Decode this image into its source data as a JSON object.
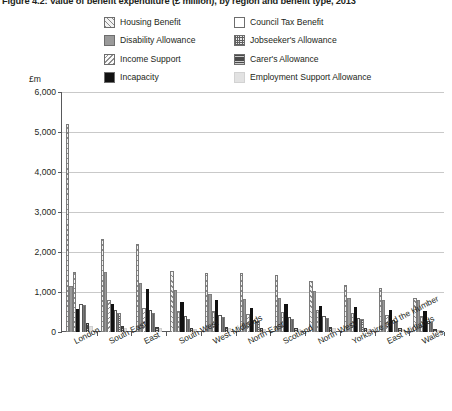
{
  "title": "Figure 4.2: Value of benefit expenditure (£ million), by region and benefit type, 2013",
  "axis": {
    "y_unit": "£m",
    "y_ticks": [
      "6,000",
      "5,000",
      "4,000",
      "3,000",
      "2,000",
      "1,000",
      "0"
    ]
  },
  "legend": {
    "items": [
      {
        "label": "Housing Benefit",
        "pattern": "p-housing",
        "icon": "diagonal-hatch-swatch"
      },
      {
        "label": "Council Tax Benefit",
        "pattern": "p-council",
        "icon": "empty-swatch"
      },
      {
        "label": "Disability Allowance",
        "pattern": "p-disability",
        "icon": "solid-grey-swatch"
      },
      {
        "label": "Jobseeker's Allowance",
        "pattern": "p-jobseeker",
        "icon": "crosshatch-swatch"
      },
      {
        "label": "Income Support",
        "pattern": "p-income",
        "icon": "reverse-hatch-swatch"
      },
      {
        "label": "Carer's Allowance",
        "pattern": "p-carer",
        "icon": "dark-textured-swatch"
      },
      {
        "label": "Incapacity",
        "pattern": "p-incapacity",
        "icon": "solid-black-swatch"
      },
      {
        "label": "Employment Support Allowance",
        "pattern": "p-esa",
        "icon": "light-grey-swatch"
      }
    ]
  },
  "chart_data": {
    "type": "bar",
    "title": "Figure 4.2: Value of benefit expenditure (£ million), by region and benefit type, 2013",
    "xlabel": "",
    "ylabel": "£m",
    "ylim": [
      0,
      6000
    ],
    "ytick_step": 1000,
    "grid": true,
    "legend_position": "top",
    "categories": [
      "London",
      "South East",
      "East",
      "South West",
      "West Midlands",
      "North East",
      "Scotland",
      "North West",
      "Yorkshire and the Humber",
      "East Midlands",
      "Wales"
    ],
    "series": [
      {
        "name": "Housing Benefit",
        "pattern": "p-housing",
        "values": [
          5200,
          2330,
          2210,
          1520,
          1470,
          1480,
          1420,
          1270,
          1180,
          1090,
          860
        ]
      },
      {
        "name": "Disability Allowance",
        "pattern": "p-disability",
        "values": [
          1150,
          1500,
          1230,
          1060,
          960,
          830,
          860,
          1030,
          850,
          790,
          810
        ]
      },
      {
        "name": "Income Support",
        "pattern": "p-income",
        "values": [
          1500,
          790,
          610,
          520,
          530,
          440,
          510,
          540,
          480,
          430,
          390
        ]
      },
      {
        "name": "Incapacity",
        "pattern": "p-incapacity",
        "values": [
          580,
          690,
          1080,
          760,
          800,
          610,
          690,
          660,
          620,
          560,
          530
        ]
      },
      {
        "name": "Council Tax Benefit",
        "pattern": "p-council",
        "values": [
          700,
          540,
          560,
          400,
          420,
          310,
          370,
          410,
          350,
          310,
          270
        ]
      },
      {
        "name": "Jobseeker's Allowance",
        "pattern": "p-jobseeker",
        "values": [
          670,
          480,
          470,
          330,
          380,
          280,
          330,
          360,
          320,
          280,
          240
        ]
      },
      {
        "name": "Carer's Allowance",
        "pattern": "p-carer",
        "values": [
          230,
          150,
          130,
          110,
          120,
          90,
          110,
          120,
          100,
          90,
          80
        ]
      },
      {
        "name": "Employment Support Allowance",
        "pattern": "p-esa",
        "values": [
          140,
          110,
          100,
          80,
          90,
          70,
          80,
          90,
          75,
          65,
          55
        ]
      }
    ]
  }
}
